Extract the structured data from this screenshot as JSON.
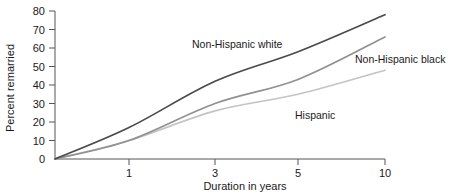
{
  "chart_data": {
    "type": "line",
    "title": "",
    "xlabel": "Duration in years",
    "ylabel": "Percent remarried",
    "x_tick_labels": [
      "1",
      "3",
      "5",
      "10"
    ],
    "x_scale": "ordinal-equal-spaced",
    "y_tick_labels": [
      "0",
      "10",
      "20",
      "30",
      "40",
      "50",
      "60",
      "70",
      "80"
    ],
    "ylim": [
      0,
      80
    ],
    "y_tick_step": 10,
    "grid": false,
    "legend": "inline-annotations",
    "categories": [
      "0",
      "1",
      "3",
      "5",
      "10"
    ],
    "series": [
      {
        "name": "Non-Hispanic white",
        "color": "#4a4a4a",
        "values": [
          0,
          17,
          42,
          58,
          78
        ],
        "label_x": 192,
        "label_y": 48
      },
      {
        "name": "Non-Hispanic black",
        "color": "#909090",
        "values": [
          0,
          10,
          30,
          43,
          66
        ],
        "label_x": 355,
        "label_y": 63
      },
      {
        "name": "Hispanic",
        "color": "#c4c4c4",
        "values": [
          0,
          10,
          26,
          35,
          48
        ],
        "label_x": 295,
        "label_y": 119
      }
    ]
  },
  "axes": {
    "y_label": "Percent remarried",
    "x_label": "Duration in years",
    "y_ticks": [
      {
        "value": "80",
        "y": 11
      },
      {
        "value": "70",
        "y": 29.5
      },
      {
        "value": "60",
        "y": 48
      },
      {
        "value": "50",
        "y": 66.5
      },
      {
        "value": "40",
        "y": 85
      },
      {
        "value": "30",
        "y": 103.5
      },
      {
        "value": "20",
        "y": 122
      },
      {
        "value": "10",
        "y": 140.5
      },
      {
        "value": "0",
        "y": 159
      }
    ],
    "x_ticks": [
      {
        "value": "1",
        "x": 129
      },
      {
        "value": "3",
        "x": 215
      },
      {
        "value": "5",
        "x": 298
      },
      {
        "value": "10",
        "x": 385
      }
    ],
    "axis_color": "#555555",
    "origin_x": 55,
    "origin_y": 159
  }
}
